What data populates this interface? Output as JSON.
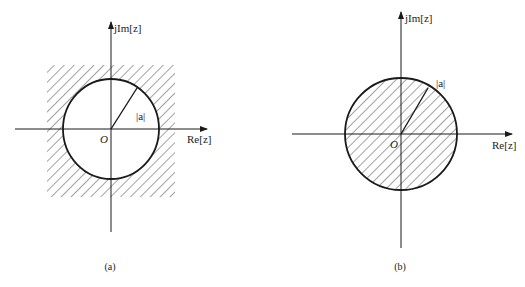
{
  "figures": [
    {
      "id": "a",
      "caption": "(a)",
      "axis_labels": {
        "imag": "jIm[z]",
        "real": "Re[z]"
      },
      "origin_label": "O",
      "radius_label": "|a|",
      "shaded_region": "outside circle |z| > |a|"
    },
    {
      "id": "b",
      "caption": "(b)",
      "axis_labels": {
        "imag": "jIm[z]",
        "real": "Re[z]"
      },
      "origin_label": "O",
      "radius_label": "|a|",
      "shaded_region": "inside circle |z| < |a|"
    }
  ],
  "colors": {
    "line": "#1a1a1a",
    "hatch": "#333333",
    "background": "#ffffff"
  }
}
